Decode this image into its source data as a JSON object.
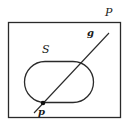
{
  "diagram": {
    "labels": {
      "plane": "P",
      "set": "S",
      "line": "g",
      "point": "p"
    },
    "colors": {
      "stroke": "#2a2a2a",
      "background": "#ffffff"
    },
    "elements": [
      {
        "type": "rectangle",
        "name": "plane P",
        "x": 8,
        "y": 22,
        "width": 113,
        "height": 96
      },
      {
        "type": "rounded-rectangle",
        "name": "set S",
        "x": 24,
        "y": 61,
        "width": 70,
        "height": 42,
        "radius": 21
      },
      {
        "type": "line",
        "name": "line g",
        "x1": 34,
        "y1": 113,
        "x2": 109,
        "y2": 33
      },
      {
        "type": "point",
        "name": "point p",
        "x": 43,
        "y": 103
      }
    ]
  }
}
